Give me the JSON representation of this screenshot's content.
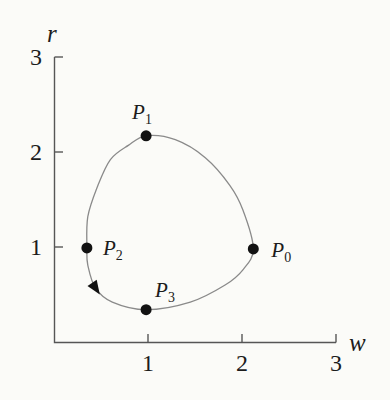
{
  "figure": {
    "background": "#fbfbf8",
    "axis_color": "#565656",
    "curve_color": "#8a8a8a",
    "point_color": "#121212",
    "text_color": "#1c1c1c"
  },
  "chart_data": {
    "type": "line",
    "title": "",
    "xlabel": "w",
    "ylabel": "r",
    "xlim": [
      0,
      3
    ],
    "ylim": [
      0,
      3
    ],
    "xticks": [
      1,
      2,
      3
    ],
    "yticks": [
      1,
      2,
      3
    ],
    "grid": false,
    "legend": false,
    "series": [
      {
        "name": "closed-orbit",
        "closed": true,
        "points": [
          [
            2.12,
            0.98
          ],
          [
            2.01,
            1.39
          ],
          [
            1.87,
            1.65
          ],
          [
            1.61,
            1.94
          ],
          [
            1.29,
            2.13
          ],
          [
            0.98,
            2.17
          ],
          [
            0.79,
            2.07
          ],
          [
            0.6,
            1.92
          ],
          [
            0.46,
            1.63
          ],
          [
            0.36,
            1.32
          ],
          [
            0.35,
            0.99
          ],
          [
            0.36,
            0.81
          ],
          [
            0.44,
            0.57
          ],
          [
            0.62,
            0.42
          ],
          [
            0.98,
            0.34
          ],
          [
            1.45,
            0.42
          ],
          [
            1.82,
            0.6
          ],
          [
            2.01,
            0.76
          ]
        ]
      }
    ],
    "marked_points": [
      {
        "base": "P",
        "sub": "0",
        "w": 2.12,
        "r": 0.98
      },
      {
        "base": "P",
        "sub": "1",
        "w": 0.98,
        "r": 2.17
      },
      {
        "base": "P",
        "sub": "2",
        "w": 0.35,
        "r": 0.99
      },
      {
        "base": "P",
        "sub": "3",
        "w": 0.98,
        "r": 0.34
      }
    ],
    "arrow": {
      "w": 0.44,
      "r": 0.57,
      "direction": "counterclockwise (P0 to P1 to P2 to P3)"
    }
  }
}
